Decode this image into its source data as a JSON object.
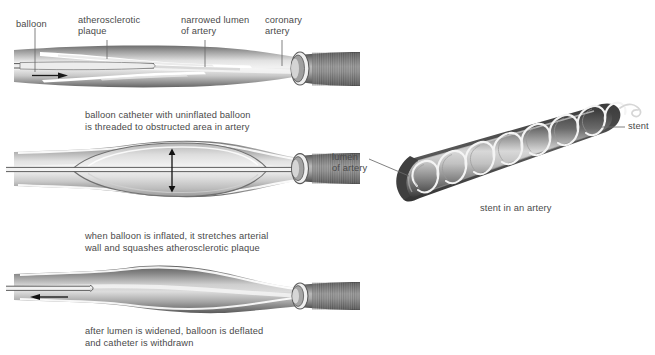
{
  "figure": {
    "background_color": "#ffffff",
    "text_color": "#4a4a4a",
    "artery_wall_dark": "#4f4f4f",
    "artery_mid": "#9a9a9a",
    "artery_light": "#e9e9e9",
    "plaque_color": "#ffffff",
    "stent_wire_color": "#f2f2f2"
  },
  "panel1": {
    "name": "balloon catheter threaded into narrowed artery",
    "labels": [
      {
        "id": "balloon",
        "text": "balloon"
      },
      {
        "id": "plaque",
        "text": "atherosclerotic\nplaque"
      },
      {
        "id": "lumen",
        "text": "narrowed lumen\nof artery"
      },
      {
        "id": "artery",
        "text": "coronary\nartery"
      }
    ],
    "arrow_direction": "right",
    "caption": "balloon catheter with uninflated balloon\nis threaded to obstructed area in artery"
  },
  "panel2": {
    "name": "balloon inflated stretching arterial wall",
    "arrow_direction": "vertical-double",
    "caption": "when balloon is inflated, it stretches arterial\nwall and squashes atherosclerotic plaque"
  },
  "panel3": {
    "name": "balloon deflated and catheter withdrawn",
    "arrow_direction": "left",
    "caption": "after lumen is widened, balloon is deflated\nand catheter is withdrawn"
  },
  "panel4": {
    "name": "stent in an artery",
    "labels": [
      {
        "id": "lumen",
        "text": "lumen\nof artery"
      },
      {
        "id": "stent",
        "text": "stent"
      }
    ],
    "caption": "stent in an artery",
    "coil_loops": 8
  }
}
